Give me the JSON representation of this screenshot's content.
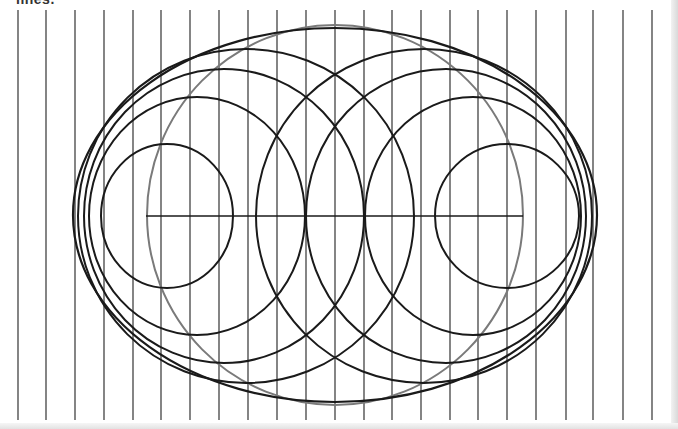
{
  "caption": "lines.",
  "colors": {
    "background": "#ffffff",
    "ink": "#1a1a1a",
    "gray_ink": "#7a7a7a",
    "rule": "#333333"
  },
  "vertical_lines": {
    "x_positions": [
      18,
      46,
      75,
      104,
      133,
      161,
      190,
      219,
      248,
      277,
      306,
      335,
      364,
      392,
      421,
      450,
      478,
      507,
      536,
      566,
      593,
      623,
      652
    ],
    "y_top": 10,
    "y_bottom": 420
  },
  "axis_line": {
    "x1": 146,
    "x2": 523,
    "y": 216
  },
  "outer_ellipse": {
    "cx": 335,
    "cy": 215,
    "rx": 262,
    "ry": 187
  },
  "gray_circle": {
    "cx": 335,
    "cy": 215,
    "rx": 188,
    "ry": 190
  },
  "left_family": [
    {
      "cx": 167,
      "cy": 216,
      "rx": 66,
      "ry": 72
    },
    {
      "cx": 197,
      "cy": 216,
      "rx": 108,
      "ry": 119
    },
    {
      "cx": 224,
      "cy": 216,
      "rx": 140,
      "ry": 147
    },
    {
      "cx": 246,
      "cy": 216,
      "rx": 168,
      "ry": 167
    }
  ],
  "right_family": [
    {
      "cx": 507,
      "cy": 216,
      "rx": 72,
      "ry": 72
    },
    {
      "cx": 473,
      "cy": 216,
      "rx": 108,
      "ry": 119
    },
    {
      "cx": 446,
      "cy": 216,
      "rx": 140,
      "ry": 147
    },
    {
      "cx": 424,
      "cy": 216,
      "rx": 168,
      "ry": 167
    }
  ]
}
